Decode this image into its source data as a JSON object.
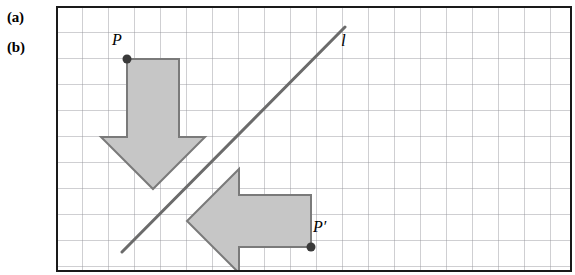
{
  "figure": {
    "part_labels": [
      {
        "name": "label-a",
        "text": "(a)"
      },
      {
        "name": "label-b",
        "text": "(b)"
      }
    ],
    "point_labels": [
      {
        "name": "label-P",
        "text": "P"
      },
      {
        "name": "label-Pp",
        "text": "P′"
      },
      {
        "name": "label-l",
        "text": "l"
      }
    ],
    "colors": {
      "background": "#ffffff",
      "frame_border": "#1a1a1a",
      "grid_line": "#8e8e96",
      "shape_fill": "#c6c6c6",
      "shape_stroke": "#7a7a7a",
      "line_stroke": "#6b6b6b",
      "point_fill": "#3a3a3a",
      "text": "#000000"
    },
    "frame": {
      "x": 0,
      "y": 0,
      "width": 516,
      "height": 266,
      "border_width": 2
    },
    "grid": {
      "cell_size": 26,
      "columns": 20,
      "rows": 10,
      "line_width": 1
    },
    "shapes": [
      {
        "name": "down-arrow",
        "kind": "arrow",
        "direction": "down",
        "points": "71,53 123,53 123,131 149,131 97,183 45,131 71,131"
      },
      {
        "name": "left-arrow",
        "kind": "arrow",
        "direction": "left",
        "points": "183,163 183,189 255,189 255,241 183,241 183,267 131,215"
      }
    ],
    "line": {
      "name": "reflection-line-l",
      "x1": 66,
      "y1": 246,
      "x2": 289,
      "y2": 21,
      "stroke_width": 3
    },
    "points": [
      {
        "name": "point-P",
        "cx": 71,
        "cy": 53,
        "r": 4.5
      },
      {
        "name": "point-P-prime",
        "cx": 255,
        "cy": 241,
        "r": 4.5
      }
    ]
  }
}
